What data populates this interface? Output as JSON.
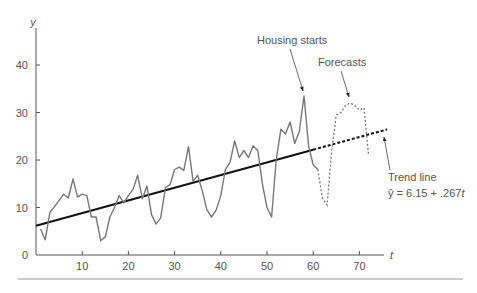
{
  "chart_data": {
    "type": "line",
    "title": "",
    "xlabel": "t",
    "ylabel": "y",
    "xlim": [
      0,
      76
    ],
    "ylim": [
      0,
      45
    ],
    "x_ticks": [
      10,
      20,
      30,
      40,
      50,
      60,
      70
    ],
    "y_ticks": [
      0,
      10,
      20,
      30,
      40
    ],
    "grid": false,
    "series": [
      {
        "name": "Housing starts",
        "style": "solid",
        "color": "#6e6e6e",
        "x": [
          1,
          2,
          3,
          4,
          5,
          6,
          7,
          8,
          9,
          10,
          11,
          12,
          13,
          14,
          15,
          16,
          17,
          18,
          19,
          20,
          21,
          22,
          23,
          24,
          25,
          26,
          27,
          28,
          29,
          30,
          31,
          32,
          33,
          34,
          35,
          36,
          37,
          38,
          39,
          40,
          41,
          42,
          43,
          44,
          45,
          46,
          47,
          48,
          49,
          50,
          51,
          52,
          53,
          54,
          55,
          56,
          57,
          58,
          59,
          60,
          61
        ],
        "values": [
          5.5,
          3.2,
          9.0,
          10.2,
          11.5,
          12.8,
          12.0,
          16.0,
          12.2,
          12.8,
          12.5,
          8.0,
          8.0,
          3.0,
          3.8,
          8.0,
          10.0,
          12.5,
          11.0,
          12.5,
          13.8,
          16.8,
          11.8,
          14.5,
          8.5,
          6.5,
          7.8,
          14.2,
          14.8,
          18.0,
          18.5,
          17.8,
          22.8,
          15.5,
          16.8,
          13.5,
          9.5,
          8.0,
          9.5,
          12.5,
          18.0,
          19.5,
          24.0,
          20.5,
          22.0,
          20.5,
          23.0,
          22.0,
          15.0,
          10.0,
          8.0,
          20.0,
          26.5,
          25.5,
          28.0,
          23.5,
          26.0,
          33.5,
          23.0,
          19.0,
          18.0
        ]
      },
      {
        "name": "Forecasts",
        "style": "dashed",
        "color": "#6e6e6e",
        "x": [
          61,
          62,
          63,
          64,
          65,
          66,
          67,
          68,
          69,
          70,
          71,
          72
        ],
        "values": [
          18.0,
          12.0,
          10.5,
          22.0,
          29.5,
          30.0,
          31.5,
          32.0,
          31.5,
          30.5,
          31.0,
          21.0
        ]
      },
      {
        "name": "Trend line",
        "style": "solid-then-dotted",
        "color": "#111111",
        "equation": "ŷ = 6.15 + .267t",
        "intercept": 6.15,
        "slope": 0.267,
        "x": [
          0,
          60,
          76
        ],
        "values": [
          6.15,
          22.17,
          26.44
        ]
      }
    ],
    "annotations": [
      {
        "text": "Housing starts",
        "points_to": {
          "t": 58,
          "y": 33.5
        }
      },
      {
        "text": "Forecasts",
        "points_to": {
          "t": 68,
          "y": 32
        }
      },
      {
        "text": "Trend line",
        "points_to": {
          "t": 75,
          "y": 26
        }
      },
      {
        "text": "ŷ = 6.15 + .267t"
      }
    ],
    "legend": "none"
  },
  "labels": {
    "y_axis": "y",
    "x_axis": "t",
    "housing_starts": "Housing starts",
    "forecasts": "Forecasts",
    "trend_line": "Trend line",
    "equation_prefix": "ŷ = 6.15 + .267",
    "equation_var": "t"
  },
  "axes": {
    "x_tick_labels": [
      "10",
      "20",
      "30",
      "40",
      "50",
      "60",
      "70"
    ],
    "y_tick_labels": [
      "0",
      "10",
      "20",
      "30",
      "40"
    ]
  }
}
